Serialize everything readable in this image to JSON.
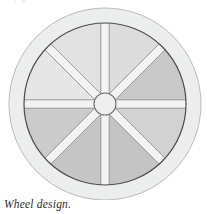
{
  "page": {
    "background_color": "#ffffff",
    "top_cropped_text": "f g",
    "caption": "Wheel design."
  },
  "figure": {
    "name": "wheel-design-illustration",
    "center": {
      "x": 105,
      "y": 104
    },
    "outer_rim": {
      "label": "outer rim band",
      "outer_radius": 96,
      "inner_radius": 81,
      "fill_color": "#eceded",
      "stroke_color": "#b9bcbd",
      "stroke_width": 1
    },
    "felloe_ring": {
      "label": "felloe inner ring",
      "radius": 81,
      "stroke_color": "#4a4c4d",
      "stroke_width": 1.2
    },
    "hub": {
      "label": "hub",
      "radius": 11,
      "fill_color": "#efefef",
      "stroke_color": "#6a6c6d",
      "stroke_width": 1.1
    },
    "spokes": {
      "count": 8,
      "label": "spoke",
      "half_width": 4.2,
      "fill_color": "#f3f3f3",
      "stroke_color": "#8d9091",
      "angles_deg": [
        0,
        45,
        90,
        135,
        180,
        225,
        270,
        315
      ]
    },
    "sectors": [
      {
        "name": "sector-1",
        "start_deg": -90,
        "end_deg": -45,
        "fill_color": "#dcdcdc"
      },
      {
        "name": "sector-2",
        "start_deg": -45,
        "end_deg": 0,
        "fill_color": "#c9c9c9"
      },
      {
        "name": "sector-3",
        "start_deg": 0,
        "end_deg": 45,
        "fill_color": "#d2d2d2"
      },
      {
        "name": "sector-4",
        "start_deg": 45,
        "end_deg": 90,
        "fill_color": "#c4c4c4"
      },
      {
        "name": "sector-5",
        "start_deg": 90,
        "end_deg": 135,
        "fill_color": "#c6c6c6"
      },
      {
        "name": "sector-6",
        "start_deg": 135,
        "end_deg": 180,
        "fill_color": "#cbcbcb"
      },
      {
        "name": "sector-7",
        "start_deg": 180,
        "end_deg": 225,
        "fill_color": "#e6e6e6"
      },
      {
        "name": "sector-8",
        "start_deg": 225,
        "end_deg": 270,
        "fill_color": "#e1e1e1"
      }
    ]
  }
}
